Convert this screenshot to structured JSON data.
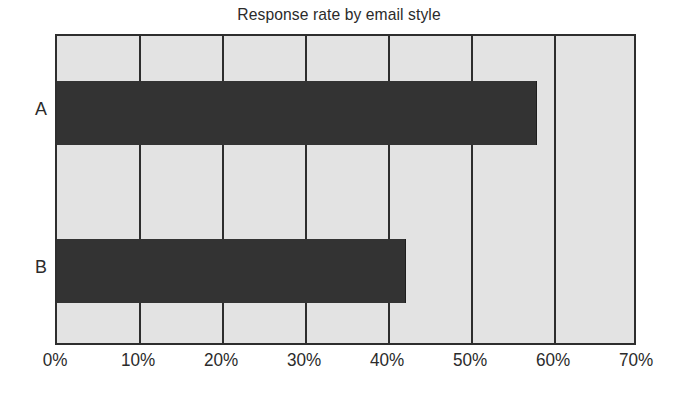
{
  "chart_data": {
    "type": "bar",
    "orientation": "horizontal",
    "title": "Response rate by email style",
    "xlabel": "",
    "ylabel": "",
    "categories": [
      "A",
      "B"
    ],
    "values": [
      57.8,
      42.0
    ],
    "series": [
      {
        "name": "Response rate",
        "values": [
          57.8,
          42.0
        ]
      }
    ],
    "xlim": [
      0,
      70
    ],
    "xtick_labels": [
      "0%",
      "10%",
      "20%",
      "30%",
      "40%",
      "50%",
      "60%",
      "70%"
    ],
    "xtick_values": [
      0,
      10,
      20,
      30,
      40,
      50,
      60,
      70
    ],
    "grid": true,
    "grid_axis": "x",
    "legend": false,
    "colors": {
      "bar": "#333333",
      "plot_background": "#e3e3e3",
      "grid": "#2e2e2e",
      "axis": "#2e2e2e",
      "text": "#2b2b2b",
      "figure_background": "#ffffff"
    }
  }
}
